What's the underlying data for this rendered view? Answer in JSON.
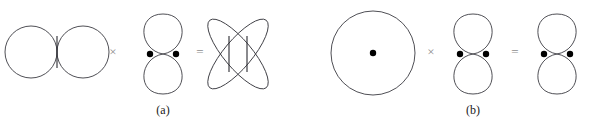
{
  "figure": {
    "type": "orbital-product-diagram",
    "background_color": "#ffffff",
    "curve_color": "#3b3b42",
    "dot_color": "#000000",
    "operator_color": "#8e8e8e",
    "label_color": "#1a1a1a"
  },
  "panels": [
    {
      "id": "a",
      "label": "(a)",
      "equation": [
        {
          "role": "operand-1",
          "name": "horizontal-two-circle-orbital",
          "shape": "two-circles-horizontal",
          "lobes": 2,
          "orientation": "horizontal",
          "dots": 0,
          "node_lines": 1,
          "center": [
            57,
            52
          ],
          "lobe_radius": 26
        },
        {
          "role": "operator",
          "name": "multiply",
          "symbol": "×"
        },
        {
          "role": "operand-2",
          "name": "vertical-p-orbital",
          "shape": "two-lobes-vertical",
          "lobes": 2,
          "orientation": "vertical",
          "dots": 2,
          "node_lines": 0,
          "center": [
            163,
            54
          ],
          "lobe_width": 25,
          "lobe_height": 42
        },
        {
          "role": "operator",
          "name": "equals",
          "symbol": "="
        },
        {
          "role": "result",
          "name": "four-lobe-d-orbital",
          "shape": "four-lobes-diagonal",
          "lobes": 4,
          "orientation": "diagonal",
          "dots": 0,
          "node_lines": 2,
          "center": [
            238,
            54
          ],
          "lobe_length": 45,
          "lobe_width": 15
        }
      ]
    },
    {
      "id": "b",
      "label": "(b)",
      "equation": [
        {
          "role": "operand-1",
          "name": "s-orbital-circle",
          "shape": "circle",
          "lobes": 1,
          "orientation": "radial",
          "dots": 1,
          "node_lines": 0,
          "center": [
            373,
            53
          ],
          "radius": 42
        },
        {
          "role": "operator",
          "name": "multiply",
          "symbol": "×"
        },
        {
          "role": "operand-2",
          "name": "vertical-p-orbital",
          "shape": "two-lobes-vertical",
          "lobes": 2,
          "orientation": "vertical",
          "dots": 2,
          "node_lines": 0,
          "center": [
            473,
            54
          ],
          "lobe_width": 25,
          "lobe_height": 42
        },
        {
          "role": "operator",
          "name": "equals",
          "symbol": "="
        },
        {
          "role": "result",
          "name": "vertical-p-orbital",
          "shape": "two-lobes-vertical",
          "lobes": 2,
          "orientation": "vertical",
          "dots": 2,
          "node_lines": 0,
          "center": [
            557,
            54
          ],
          "lobe_width": 25,
          "lobe_height": 42
        }
      ]
    }
  ],
  "operators": {
    "multiply_a": {
      "symbol": "×",
      "x": 112,
      "y": 47
    },
    "equals_a": {
      "symbol": "=",
      "x": 199,
      "y": 47
    },
    "multiply_b": {
      "symbol": "×",
      "x": 430,
      "y": 47
    },
    "equals_b": {
      "symbol": "=",
      "x": 514,
      "y": 47
    }
  },
  "labels": {
    "panel_a": "(a)",
    "panel_b": "(b)"
  }
}
